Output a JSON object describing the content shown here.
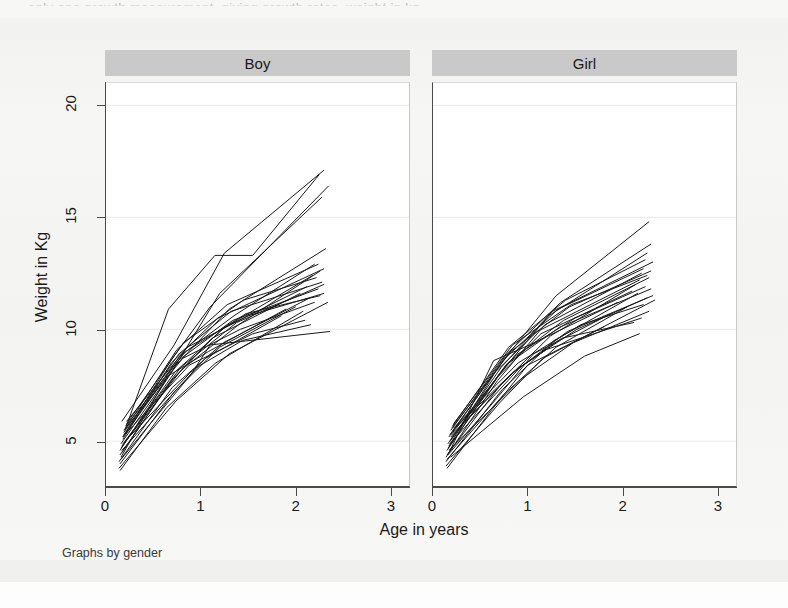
{
  "page": {
    "top_cut_text": "only one growth measurement, giving growth rates, weight in kg."
  },
  "chart_data": {
    "type": "line",
    "title": "",
    "subtitle": "",
    "xlabel": "Age in years",
    "ylabel": "Weight in Kg",
    "note": "Graphs by gender",
    "grid": true,
    "grid_axis": "y",
    "legend": "none",
    "xlim": [
      0,
      3.2
    ],
    "ylim": [
      3.0,
      21.0
    ],
    "xticks": [
      0,
      1,
      2,
      3
    ],
    "xticklabels": [
      "0",
      "1",
      "2",
      "3"
    ],
    "yticks": [
      5,
      10,
      15,
      20
    ],
    "yticklabels": [
      "5",
      "10",
      "15",
      "20"
    ],
    "line_color": "#1a1a1a",
    "line_width": 1.0,
    "panel_header_color": "#c9c9c9",
    "panels": [
      {
        "id": "boy",
        "label": "Boy",
        "n_subjects": 28,
        "series": [
          {
            "name": "b01",
            "x": [
              0.17,
              0.72,
              1.25,
              2.3
            ],
            "y": [
              5.9,
              9.3,
              13.4,
              17.1
            ]
          },
          {
            "name": "b02",
            "x": [
              0.18,
              0.7,
              1.1,
              2.35
            ],
            "y": [
              5.2,
              8.7,
              11.0,
              16.4
            ]
          },
          {
            "name": "b03",
            "x": [
              0.15,
              0.68,
              1.2,
              2.28
            ],
            "y": [
              4.6,
              8.0,
              11.6,
              15.9
            ]
          },
          {
            "name": "b04",
            "x": [
              0.2,
              0.66,
              1.15,
              1.55,
              2.25
            ],
            "y": [
              5.5,
              10.9,
              13.3,
              13.3,
              16.9
            ]
          },
          {
            "name": "b05",
            "x": [
              0.16,
              0.74,
              1.3,
              2.32
            ],
            "y": [
              4.9,
              8.4,
              10.9,
              13.6
            ]
          },
          {
            "name": "b06",
            "x": [
              0.19,
              0.78,
              1.35,
              2.2
            ],
            "y": [
              5.3,
              8.8,
              10.6,
              12.9
            ]
          },
          {
            "name": "b07",
            "x": [
              0.17,
              0.8,
              1.4,
              2.26
            ],
            "y": [
              4.8,
              8.2,
              10.2,
              12.6
            ]
          },
          {
            "name": "b08",
            "x": [
              0.21,
              0.75,
              1.28,
              2.24
            ],
            "y": [
              5.6,
              9.1,
              11.1,
              12.9
            ]
          },
          {
            "name": "b09",
            "x": [
              0.15,
              0.71,
              1.22,
              2.18
            ],
            "y": [
              4.4,
              7.8,
              10.0,
              12.4
            ]
          },
          {
            "name": "b10",
            "x": [
              0.18,
              0.69,
              1.18,
              2.3
            ],
            "y": [
              5.1,
              8.5,
              10.5,
              12.7
            ]
          },
          {
            "name": "b11",
            "x": [
              0.22,
              0.82,
              1.45,
              2.22
            ],
            "y": [
              5.8,
              9.4,
              11.3,
              12.3
            ]
          },
          {
            "name": "b12",
            "x": [
              0.16,
              0.73,
              1.26,
              2.12
            ],
            "y": [
              4.7,
              8.1,
              10.1,
              11.9
            ]
          },
          {
            "name": "b13",
            "x": [
              0.19,
              0.77,
              1.32,
              2.28
            ],
            "y": [
              5.4,
              8.9,
              10.8,
              12.1
            ]
          },
          {
            "name": "b14",
            "x": [
              0.17,
              0.67,
              1.12,
              2.05
            ],
            "y": [
              4.5,
              7.6,
              9.6,
              11.6
            ]
          },
          {
            "name": "b15",
            "x": [
              0.2,
              0.79,
              1.38,
              2.3
            ],
            "y": [
              5.0,
              8.3,
              10.3,
              12.0
            ]
          },
          {
            "name": "b16",
            "x": [
              0.14,
              0.7,
              1.24,
              2.15
            ],
            "y": [
              4.1,
              7.4,
              9.4,
              11.4
            ]
          },
          {
            "name": "b17",
            "x": [
              0.18,
              0.76,
              1.34,
              2.24
            ],
            "y": [
              5.2,
              8.6,
              10.4,
              11.8
            ]
          },
          {
            "name": "b18",
            "x": [
              0.16,
              0.65,
              1.08,
              1.9
            ],
            "y": [
              4.3,
              7.9,
              9.0,
              10.9
            ]
          },
          {
            "name": "b19",
            "x": [
              0.21,
              0.84,
              1.48,
              2.26
            ],
            "y": [
              5.7,
              9.0,
              10.7,
              11.5
            ]
          },
          {
            "name": "b20",
            "x": [
              0.15,
              0.72,
              1.2,
              2.0
            ],
            "y": [
              4.0,
              7.2,
              9.2,
              11.0
            ]
          },
          {
            "name": "b21",
            "x": [
              0.19,
              0.81,
              1.42,
              2.2
            ],
            "y": [
              5.5,
              8.7,
              10.0,
              11.2
            ]
          },
          {
            "name": "b22",
            "x": [
              0.17,
              0.68,
              1.05,
              1.85
            ],
            "y": [
              4.6,
              7.0,
              8.7,
              10.6
            ]
          },
          {
            "name": "b23",
            "x": [
              0.22,
              0.86,
              1.5,
              2.3
            ],
            "y": [
              5.9,
              9.2,
              10.6,
              11.6
            ]
          },
          {
            "name": "b24",
            "x": [
              0.14,
              0.74,
              1.3,
              2.34
            ],
            "y": [
              3.8,
              6.8,
              8.9,
              11.2
            ]
          },
          {
            "name": "b25",
            "x": [
              0.2,
              0.88,
              1.55,
              2.1
            ],
            "y": [
              5.3,
              8.4,
              9.8,
              10.4
            ]
          },
          {
            "name": "b26",
            "x": [
              0.16,
              0.9,
              1.1,
              2.36
            ],
            "y": [
              4.2,
              8.0,
              9.3,
              9.9
            ]
          },
          {
            "name": "b27",
            "x": [
              0.18,
              0.92,
              1.44,
              2.16
            ],
            "y": [
              4.9,
              8.2,
              9.5,
              10.2
            ]
          },
          {
            "name": "b28",
            "x": [
              0.15,
              0.64,
              1.16,
              2.08
            ],
            "y": [
              3.7,
              6.5,
              8.5,
              10.8
            ]
          }
        ]
      },
      {
        "id": "girl",
        "label": "Girl",
        "n_subjects": 28,
        "series": [
          {
            "name": "g01",
            "x": [
              0.17,
              0.74,
              1.3,
              2.28
            ],
            "y": [
              5.2,
              8.6,
              11.5,
              14.8
            ]
          },
          {
            "name": "g02",
            "x": [
              0.19,
              0.78,
              1.35,
              2.3
            ],
            "y": [
              5.5,
              8.9,
              11.2,
              13.8
            ]
          },
          {
            "name": "g03",
            "x": [
              0.15,
              0.7,
              1.22,
              2.26
            ],
            "y": [
              4.6,
              8.0,
              10.6,
              13.4
            ]
          },
          {
            "name": "g04",
            "x": [
              0.21,
              0.8,
              1.4,
              2.24
            ],
            "y": [
              5.7,
              9.2,
              11.3,
              13.1
            ]
          },
          {
            "name": "g05",
            "x": [
              0.16,
              0.72,
              1.26,
              2.32
            ],
            "y": [
              4.9,
              8.3,
              10.8,
              13.0
            ]
          },
          {
            "name": "g06",
            "x": [
              0.18,
              0.76,
              1.32,
              2.22
            ],
            "y": [
              5.3,
              8.7,
              10.9,
              12.7
            ]
          },
          {
            "name": "g07",
            "x": [
              0.14,
              0.68,
              1.18,
              2.2
            ],
            "y": [
              4.3,
              7.7,
              10.2,
              12.5
            ]
          },
          {
            "name": "g08",
            "x": [
              0.2,
              0.82,
              1.44,
              2.3
            ],
            "y": [
              5.6,
              9.0,
              11.0,
              12.6
            ]
          },
          {
            "name": "g09",
            "x": [
              0.17,
              0.66,
              1.1,
              2.18
            ],
            "y": [
              4.8,
              8.1,
              9.9,
              12.2
            ]
          },
          {
            "name": "g10",
            "x": [
              0.22,
              0.84,
              1.46,
              2.26
            ],
            "y": [
              5.8,
              9.3,
              11.1,
              12.4
            ]
          },
          {
            "name": "g11",
            "x": [
              0.15,
              0.71,
              1.24,
              2.14
            ],
            "y": [
              4.4,
              7.5,
              9.7,
              12.0
            ]
          },
          {
            "name": "g12",
            "x": [
              0.19,
              0.79,
              1.38,
              2.28
            ],
            "y": [
              5.1,
              8.5,
              10.4,
              12.3
            ]
          },
          {
            "name": "g13",
            "x": [
              0.16,
              0.69,
              1.14,
              2.1
            ],
            "y": [
              4.7,
              7.9,
              9.8,
              11.7
            ]
          },
          {
            "name": "g14",
            "x": [
              0.21,
              0.86,
              1.5,
              2.24
            ],
            "y": [
              5.4,
              8.8,
              10.5,
              11.9
            ]
          },
          {
            "name": "g15",
            "x": [
              0.14,
              0.73,
              1.28,
              2.16
            ],
            "y": [
              4.1,
              7.3,
              9.5,
              11.6
            ]
          },
          {
            "name": "g16",
            "x": [
              0.18,
              0.77,
              1.34,
              2.3
            ],
            "y": [
              5.0,
              8.4,
              10.1,
              11.8
            ]
          },
          {
            "name": "g17",
            "x": [
              0.17,
              0.64,
              1.02,
              1.95
            ],
            "y": [
              4.5,
              8.6,
              9.3,
              11.2
            ]
          },
          {
            "name": "g18",
            "x": [
              0.2,
              0.88,
              1.52,
              2.26
            ],
            "y": [
              5.3,
              8.2,
              10.0,
              11.4
            ]
          },
          {
            "name": "g19",
            "x": [
              0.15,
              0.75,
              1.3,
              2.05
            ],
            "y": [
              4.2,
              7.1,
              9.2,
              11.0
            ]
          },
          {
            "name": "g20",
            "x": [
              0.19,
              0.83,
              1.42,
              2.32
            ],
            "y": [
              5.2,
              8.0,
              9.9,
              11.5
            ]
          },
          {
            "name": "g21",
            "x": [
              0.16,
              0.67,
              1.06,
              1.88
            ],
            "y": [
              4.4,
              6.9,
              8.9,
              10.7
            ]
          },
          {
            "name": "g22",
            "x": [
              0.22,
              0.9,
              1.56,
              2.22
            ],
            "y": [
              5.6,
              8.5,
              10.2,
              11.1
            ]
          },
          {
            "name": "g23",
            "x": [
              0.14,
              0.7,
              1.16,
              2.34
            ],
            "y": [
              3.9,
              6.7,
              8.7,
              11.3
            ]
          },
          {
            "name": "g24",
            "x": [
              0.18,
              0.92,
              1.2,
              2.2
            ],
            "y": [
              4.9,
              8.3,
              9.1,
              10.5
            ]
          },
          {
            "name": "g25",
            "x": [
              0.17,
              0.94,
              1.48,
              2.28
            ],
            "y": [
              4.6,
              7.8,
              9.4,
              10.8
            ]
          },
          {
            "name": "g26",
            "x": [
              0.21,
              0.85,
              1.36,
              2.12
            ],
            "y": [
              5.5,
              8.1,
              9.6,
              10.3
            ]
          },
          {
            "name": "g27",
            "x": [
              0.15,
              0.62,
              1.0,
              1.8
            ],
            "y": [
              3.8,
              6.4,
              8.4,
              10.1
            ]
          },
          {
            "name": "g28",
            "x": [
              0.19,
              0.96,
              1.6,
              2.18
            ],
            "y": [
              4.3,
              7.0,
              8.8,
              9.8
            ]
          }
        ]
      }
    ]
  }
}
